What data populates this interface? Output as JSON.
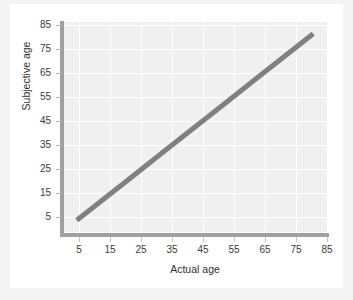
{
  "chart_data": {
    "type": "line",
    "title": "",
    "xlabel": "Actual age",
    "ylabel": "Subjective age",
    "xlim": [
      0,
      90
    ],
    "ylim": [
      0,
      90
    ],
    "x_ticks": [
      5,
      15,
      25,
      35,
      45,
      55,
      65,
      75,
      85
    ],
    "y_ticks": [
      5,
      15,
      25,
      35,
      45,
      55,
      65,
      75,
      85
    ],
    "grid": true,
    "legend": "none",
    "series": [
      {
        "name": "Subjective age vs actual age",
        "color": "#808080",
        "x": [
          5,
          15,
          25,
          35,
          45,
          55,
          65,
          75,
          85
        ],
        "values": [
          5,
          15,
          25,
          35,
          45,
          55,
          65,
          75,
          85
        ]
      }
    ],
    "annotations": []
  },
  "colors": {
    "page_background": "#f4f4f4",
    "card_background": "#ffffff",
    "plot_background": "#f0f0f0",
    "gridline": "#ffffff",
    "axis_spine": "#a0a0a0",
    "series_line": "#808080",
    "tick_text": "#3a3a3a",
    "axis_title_text": "#2f2f2f"
  }
}
